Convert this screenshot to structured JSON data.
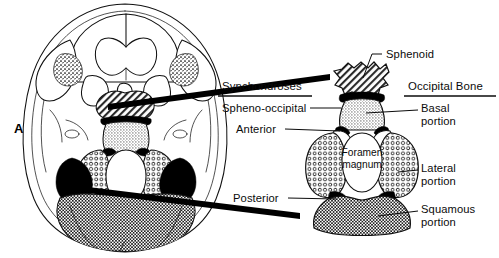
{
  "figure": {
    "panel_letter": "A",
    "background_color": "#ffffff",
    "ink_color": "#0b0b0b"
  },
  "headings": {
    "synchondroses": "Synchondroses",
    "occipital_bone": "Occipital Bone"
  },
  "labels": {
    "sphenoid": "Sphenoid",
    "spheno_occipital": "Spheno-occipital",
    "anterior": "Anterior",
    "posterior": "Posterior",
    "basal_line1": "Basal",
    "basal_line2": "portion",
    "lateral_line1": "Lateral",
    "lateral_line2": "portion",
    "squamous_line1": "Squamous",
    "squamous_line2": "portion",
    "foramen_line1": "Foramen",
    "foramen_line2": "magnum"
  },
  "regions": [
    {
      "id": "sphenoid",
      "name": "Sphenoid",
      "pattern": "diagonal-hatch",
      "color": "#9a9a9a"
    },
    {
      "id": "basal-portion",
      "name": "Basal portion",
      "pattern": "fine-stipple",
      "color": "#d8d8d8"
    },
    {
      "id": "lateral-portion",
      "name": "Lateral portion",
      "pattern": "ring-stipple",
      "color": "#cfcfcf"
    },
    {
      "id": "squamous-portion",
      "name": "Squamous portion",
      "pattern": "checker",
      "color": "#b8b8b8"
    },
    {
      "id": "synchondrosis",
      "name": "Synchondrosis",
      "pattern": "solid-black",
      "color": "#000000"
    }
  ]
}
